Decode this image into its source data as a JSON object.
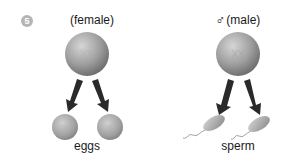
{
  "step": {
    "number": "5"
  },
  "female": {
    "title": "(female)",
    "parent_cell": {
      "chromosomes": "XX"
    },
    "gametes": [
      {
        "chromosome": "X"
      },
      {
        "chromosome": "X"
      }
    ],
    "gamete_label": "eggs"
  },
  "male": {
    "symbol": "♂",
    "title": "(male)",
    "parent_cell": {
      "chromosomes": "XY"
    },
    "gametes": [
      {
        "chromosome": "X"
      },
      {
        "chromosome": "Y"
      }
    ],
    "gamete_label": "sperm"
  },
  "colors": {
    "cell_light": "#c8c8c8",
    "cell_dark": "#7a7a7a",
    "arrow": "#2a2a2a",
    "step_badge": "#b5b5b5"
  }
}
